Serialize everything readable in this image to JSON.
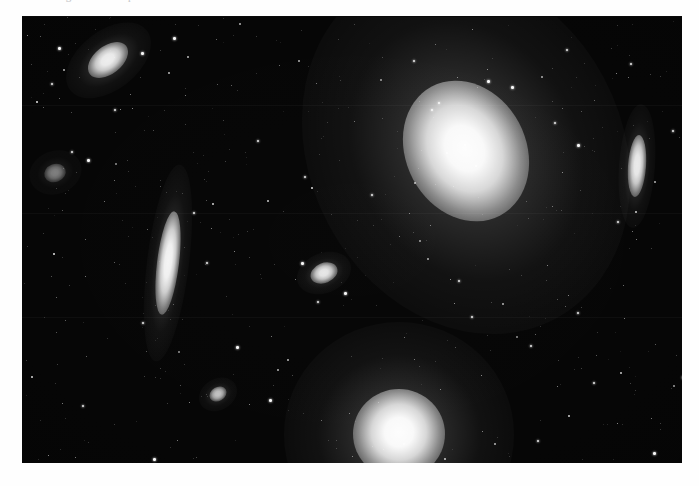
{
  "page": {
    "background_color": "#fefefe",
    "caption_sliver_text": "of the Virgo cluster  —  plate scan",
    "caption_sliver_color": "#b9b9bd"
  },
  "plate": {
    "label": "astronomical-photographic-plate",
    "background_color": "#050505",
    "left": 22,
    "top": 17,
    "width": 660,
    "height": 446,
    "seams_y": [
      88,
      196,
      300
    ]
  },
  "image_content": {
    "subject": "deep-sky field of galaxies with dense foreground star field",
    "rendering": "monochrome negative-inverted photographic plate scan",
    "object_count": 8,
    "star_count": 420
  },
  "objects": [
    {
      "name": "galaxy-inclined-spiral-upper-left",
      "cx": 86,
      "cy": 43,
      "rx": 23,
      "ry": 14,
      "angle": -38,
      "brightness": 0.92,
      "halo": 2.1,
      "type": "lenticular"
    },
    {
      "name": "galaxy-faint-fuzz-left-edge",
      "cx": 33,
      "cy": 156,
      "rx": 11,
      "ry": 9,
      "angle": -20,
      "brightness": 0.42,
      "halo": 2.4,
      "type": "elliptical"
    },
    {
      "name": "galaxy-edge-on-left",
      "cx": 146,
      "cy": 246,
      "rx": 11,
      "ry": 52,
      "angle": 7,
      "brightness": 0.95,
      "halo": 1.9,
      "type": "edge-on-spiral"
    },
    {
      "name": "galaxy-giant-elliptical-center",
      "cx": 444,
      "cy": 134,
      "rx": 60,
      "ry": 73,
      "angle": -28,
      "brightness": 1.0,
      "halo": 2.6,
      "type": "giant-elliptical"
    },
    {
      "name": "galaxy-small-elliptical-center",
      "cx": 302,
      "cy": 256,
      "rx": 14,
      "ry": 10,
      "angle": -22,
      "brightness": 0.88,
      "halo": 2.0,
      "type": "elliptical"
    },
    {
      "name": "galaxy-edge-on-right-edge",
      "cx": 615,
      "cy": 149,
      "rx": 9,
      "ry": 31,
      "angle": 4,
      "brightness": 0.9,
      "halo": 2.0,
      "type": "edge-on-lenticular"
    },
    {
      "name": "galaxy-small-elliptical-lower-left",
      "cx": 196,
      "cy": 377,
      "rx": 9,
      "ry": 7,
      "angle": -30,
      "brightness": 0.7,
      "halo": 2.2,
      "type": "elliptical"
    },
    {
      "name": "galaxy-bright-elliptical-bottom",
      "cx": 377,
      "cy": 417,
      "rx": 46,
      "ry": 45,
      "angle": 0,
      "brightness": 1.0,
      "halo": 2.5,
      "type": "giant-elliptical"
    }
  ],
  "bright_stars": [
    {
      "x": 120,
      "y": 36,
      "s": 3
    },
    {
      "x": 152,
      "y": 21,
      "s": 3
    },
    {
      "x": 37,
      "y": 31,
      "s": 3
    },
    {
      "x": 30,
      "y": 67,
      "s": 2
    },
    {
      "x": 93,
      "y": 93,
      "s": 2
    },
    {
      "x": 66,
      "y": 143,
      "s": 3
    },
    {
      "x": 50,
      "y": 135,
      "s": 2
    },
    {
      "x": 466,
      "y": 64,
      "s": 3
    },
    {
      "x": 490,
      "y": 70,
      "s": 3
    },
    {
      "x": 410,
      "y": 93,
      "s": 2
    },
    {
      "x": 417,
      "y": 86,
      "s": 2
    },
    {
      "x": 392,
      "y": 44,
      "s": 2
    },
    {
      "x": 556,
      "y": 128,
      "s": 3
    },
    {
      "x": 533,
      "y": 106,
      "s": 2
    },
    {
      "x": 596,
      "y": 205,
      "s": 2
    },
    {
      "x": 651,
      "y": 114,
      "s": 2
    },
    {
      "x": 280,
      "y": 246,
      "s": 3
    },
    {
      "x": 323,
      "y": 276,
      "s": 3
    },
    {
      "x": 296,
      "y": 285,
      "s": 2
    },
    {
      "x": 172,
      "y": 196,
      "s": 2
    },
    {
      "x": 185,
      "y": 246,
      "s": 2
    },
    {
      "x": 121,
      "y": 306,
      "s": 2
    },
    {
      "x": 215,
      "y": 330,
      "s": 3
    },
    {
      "x": 248,
      "y": 383,
      "s": 3
    },
    {
      "x": 132,
      "y": 442,
      "s": 3
    },
    {
      "x": 61,
      "y": 389,
      "s": 2
    },
    {
      "x": 314,
      "y": 456,
      "s": 2
    },
    {
      "x": 450,
      "y": 300,
      "s": 2
    },
    {
      "x": 509,
      "y": 329,
      "s": 2
    },
    {
      "x": 556,
      "y": 296,
      "s": 2
    },
    {
      "x": 572,
      "y": 366,
      "s": 2
    },
    {
      "x": 661,
      "y": 360,
      "s": 3
    },
    {
      "x": 632,
      "y": 436,
      "s": 3
    },
    {
      "x": 516,
      "y": 424,
      "s": 2
    },
    {
      "x": 437,
      "y": 264,
      "s": 2
    },
    {
      "x": 350,
      "y": 178,
      "s": 2
    },
    {
      "x": 236,
      "y": 124,
      "s": 2
    },
    {
      "x": 283,
      "y": 160,
      "s": 2
    },
    {
      "x": 609,
      "y": 47,
      "s": 2
    },
    {
      "x": 545,
      "y": 33,
      "s": 2
    }
  ]
}
